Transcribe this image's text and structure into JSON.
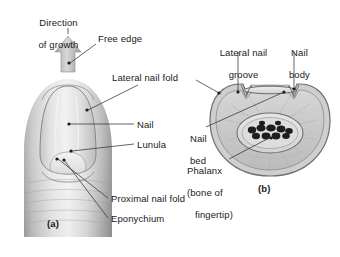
{
  "figure": {
    "background_color": "#ffffff",
    "text_color": "#1a1a1a",
    "leader_color": "#3c3c3c"
  },
  "panels": [
    {
      "id": "a",
      "label": "(a)",
      "x": 47,
      "y": 218,
      "description": "surface view of fingertip and nail"
    },
    {
      "id": "b",
      "label": "(b)",
      "x": 258,
      "y": 183,
      "description": "cross section through fingertip"
    }
  ],
  "labels": [
    {
      "name": "direction-of-growth",
      "lines": [
        "Direction",
        "of growth"
      ],
      "x": 22,
      "y": 6,
      "align": "center",
      "width": 62
    },
    {
      "name": "free-edge",
      "lines": [
        "Free edge"
      ],
      "x": 98,
      "y": 33,
      "align": "left",
      "width": 60
    },
    {
      "name": "lateral-nail-fold",
      "lines": [
        "Lateral nail fold"
      ],
      "x": 112,
      "y": 72,
      "align": "left",
      "width": 84
    },
    {
      "name": "nail",
      "lines": [
        "Nail"
      ],
      "x": 136,
      "y": 120,
      "align": "left",
      "width": 30
    },
    {
      "name": "lunula",
      "lines": [
        "Lunula"
      ],
      "x": 136,
      "y": 140,
      "align": "left",
      "width": 40
    },
    {
      "name": "proximal-nail-fold",
      "lines": [
        "Proximal nail fold"
      ],
      "x": 110,
      "y": 195,
      "align": "left",
      "width": 92
    },
    {
      "name": "eponychium",
      "lines": [
        "Eponychium"
      ],
      "x": 110,
      "y": 215,
      "align": "left",
      "width": 66
    },
    {
      "name": "lateral-nail-groove",
      "lines": [
        "Lateral nail",
        "groove"
      ],
      "x": 208,
      "y": 37,
      "align": "center",
      "width": 62
    },
    {
      "name": "nail-body",
      "lines": [
        "Nail",
        "body"
      ],
      "x": 278,
      "y": 37,
      "align": "center",
      "width": 36
    },
    {
      "name": "nail-bed",
      "lines": [
        "Nail",
        "bed"
      ],
      "x": 180,
      "y": 125,
      "align": "left",
      "width": 28
    },
    {
      "name": "phalanx",
      "lines": [
        "Phalanx",
        "(bone of",
        "fingertip)"
      ],
      "x": 176,
      "y": 157,
      "align": "left",
      "width": 50
    }
  ],
  "leaders": [
    {
      "name": "leader-direction-of-growth",
      "points": "66,47 66,30"
    },
    {
      "name": "leader-free-edge",
      "points": "96,44 70,62"
    },
    {
      "name": "leader-lateral-nail-fold",
      "points": "138,86 86,108"
    },
    {
      "name": "leader-nail",
      "points": "134,124 68,124"
    },
    {
      "name": "leader-lunula",
      "points": "134,144 72,150"
    },
    {
      "name": "leader-proximal-nail-fold",
      "points": "108,198 56,158"
    },
    {
      "name": "leader-eponychium",
      "points": "108,218 62,158"
    },
    {
      "name": "leader-lateral-nail-groove",
      "points": "238,50 238,92"
    },
    {
      "name": "leader-nail-body",
      "points": "294,50 294,88"
    },
    {
      "name": "leader-lateral-nail-fold-b",
      "points": "196,80 220,94"
    },
    {
      "name": "leader-nail-bed",
      "points": "208,128 285,92"
    },
    {
      "name": "leader-phalanx",
      "points": "228,160 272,133"
    }
  ],
  "anatomy_a": {
    "name": "fingertip-surface-view",
    "parts": [
      "free edge",
      "nail plate",
      "lunula",
      "lateral nail fold",
      "proximal nail fold",
      "eponychium",
      "growth arrow"
    ]
  },
  "anatomy_b": {
    "name": "fingertip-cross-section",
    "parts": [
      "nail body",
      "lateral nail groove",
      "lateral nail fold",
      "nail bed",
      "phalanx bone",
      "dermis",
      "epidermis"
    ]
  }
}
